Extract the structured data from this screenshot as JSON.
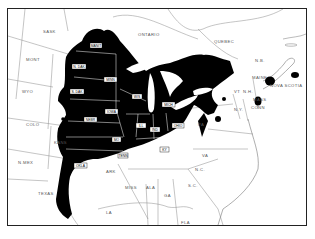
{
  "map": {
    "type": "distribution range map",
    "region": "Eastern North America",
    "range_color": "#000000",
    "background_color": "#ffffff",
    "border_color": "#888888",
    "labels_unshaded": {
      "sask": "SASK",
      "ontario": "ONTARIO",
      "quebec": "QUEBEC",
      "mont": "MONT",
      "wyo": "WYO",
      "colo": "COLO",
      "kans": "KANS",
      "nmex": "N.MEX",
      "texas": "TEXAS",
      "ark": "ARK",
      "miss": "MISS",
      "ala": "ALA",
      "ga": "GA",
      "la": "LA",
      "fla": "FLA",
      "sc": "S.C.",
      "nc": "N.C.",
      "va": "VA",
      "pa": "PA",
      "ny": "N.Y.",
      "vt": "VT",
      "nh": "N.H.",
      "maine": "MAINE",
      "mass": "MASS",
      "conn": "CONN",
      "nb": "N.B.",
      "nova_scotia": "NOVA SCOTIA"
    },
    "labels_shaded": {
      "manit": "MANIT",
      "ndak": "N. DAK",
      "sdak": "S. DAK",
      "minn": "MINN",
      "wis": "WIS",
      "mich": "MICH",
      "iowa": "IOWA",
      "nebr": "NEBR",
      "mo": "MO",
      "ill": "ILL",
      "ind": "IND",
      "ohio": "OHIO",
      "ky": "KY",
      "okla": "OKLA",
      "tenn": "TENN"
    }
  }
}
